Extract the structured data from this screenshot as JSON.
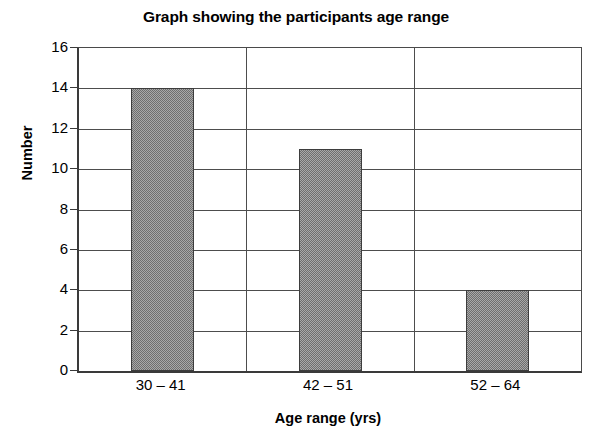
{
  "chart_data": {
    "type": "bar",
    "title": "Graph showing the participants age range",
    "xlabel": "Age range (yrs)",
    "ylabel": "Number",
    "categories": [
      "30 – 41",
      "42 – 51",
      "52 – 64"
    ],
    "values": [
      14,
      11,
      4
    ],
    "ylim": [
      0,
      16
    ],
    "ytick_step": 2,
    "yticks": [
      "0",
      "2",
      "4",
      "6",
      "8",
      "10",
      "12",
      "14",
      "16"
    ],
    "grid": "horizontal-and-category-dividers",
    "legend": "none",
    "series": [
      {
        "name": "Number",
        "values": [
          14,
          11,
          4
        ]
      }
    ],
    "colors": {
      "bar_fill": "#8a8a8a",
      "bar_border": "#3d3d3d",
      "gridline": "#4d4d4d",
      "axis": "#3a3a3a",
      "background": "#ffffff",
      "text": "#000000"
    }
  }
}
